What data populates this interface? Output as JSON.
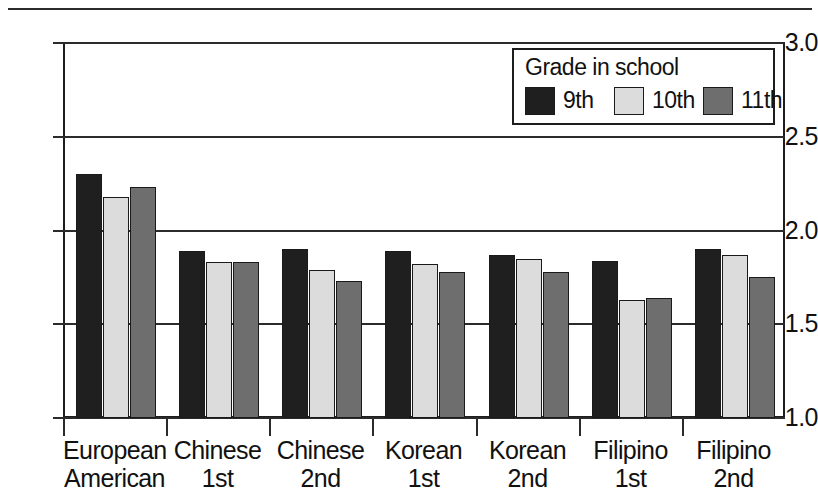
{
  "chart_data": {
    "type": "bar",
    "title": "",
    "xlabel": "",
    "ylabel": "",
    "ylim": [
      1.0,
      3.0
    ],
    "ytick_labels": [
      "3.0",
      "2.5",
      "2.0",
      "1.5",
      "1.0"
    ],
    "ytick_values": [
      3.0,
      2.5,
      2.0,
      1.5,
      1.0
    ],
    "grid": true,
    "legend_position": "top-right",
    "legend_title": "Grade in school",
    "categories": [
      {
        "line1": "European",
        "line2": "American"
      },
      {
        "line1": "Chinese",
        "line2": "1st"
      },
      {
        "line1": "Chinese",
        "line2": "2nd"
      },
      {
        "line1": "Korean",
        "line2": "1st"
      },
      {
        "line1": "Korean",
        "line2": "2nd"
      },
      {
        "line1": "Filipino",
        "line2": "1st"
      },
      {
        "line1": "Filipino",
        "line2": "2nd"
      }
    ],
    "series": [
      {
        "name": "9th",
        "color": "#1f1f1f",
        "values": [
          2.3,
          1.89,
          1.9,
          1.89,
          1.87,
          1.84,
          1.9
        ]
      },
      {
        "name": "10th",
        "color": "#dcdcdc",
        "values": [
          2.18,
          1.83,
          1.79,
          1.82,
          1.85,
          1.63,
          1.87
        ]
      },
      {
        "name": "11th",
        "color": "#6e6e6e",
        "values": [
          2.23,
          1.83,
          1.73,
          1.78,
          1.78,
          1.64,
          1.75
        ]
      }
    ]
  }
}
